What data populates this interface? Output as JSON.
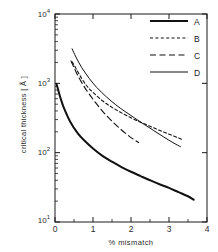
{
  "chart_data": {
    "type": "line",
    "title": "",
    "xlabel": "% mismatch",
    "ylabel": "critical thickness  [ Å ]",
    "xlim": [
      0,
      4
    ],
    "ylim": [
      10,
      10000
    ],
    "yscale": "log",
    "xscale": "linear",
    "grid": false,
    "legend_position": "top-right-inside",
    "xticks": [
      "0",
      "1",
      "2",
      "3",
      "4"
    ],
    "xtick_values": [
      0,
      1,
      2,
      3,
      4
    ],
    "yticks": [
      "10¹",
      "10²",
      "10³",
      "10⁴"
    ],
    "ytick_values": [
      10,
      100,
      1000,
      10000
    ],
    "ytick_bases": [
      "10",
      "10",
      "10",
      "10"
    ],
    "ytick_exponents": [
      "1",
      "2",
      "3",
      "4"
    ],
    "series": [
      {
        "name": "A",
        "style": "solid",
        "linewidth": 2.0,
        "color": "#111111",
        "x": [
          0.04,
          0.08,
          0.15,
          0.25,
          0.4,
          0.6,
          0.8,
          1.0,
          1.25,
          1.5,
          1.75,
          2.0,
          2.25,
          2.5,
          2.75,
          3.0,
          3.25,
          3.5,
          3.65
        ],
        "y": [
          980,
          820,
          600,
          420,
          280,
          190,
          145,
          115,
          90,
          74,
          62,
          53,
          46,
          40,
          35,
          31,
          27,
          23.5,
          21
        ]
      },
      {
        "name": "B",
        "style": "dashed-short",
        "linewidth": 1.1,
        "color": "#111111",
        "x": [
          0.45,
          0.55,
          0.7,
          0.85,
          1.0,
          1.25,
          1.5,
          1.75,
          2.0,
          2.25,
          2.5,
          2.75,
          3.0,
          3.25,
          3.35
        ],
        "y": [
          2050,
          1650,
          1180,
          900,
          740,
          560,
          450,
          375,
          318,
          275,
          240,
          210,
          185,
          163,
          155
        ]
      },
      {
        "name": "C",
        "style": "dashed-long",
        "linewidth": 1.1,
        "color": "#111111",
        "x": [
          0.42,
          0.5,
          0.6,
          0.75,
          0.9,
          1.1,
          1.3,
          1.5,
          1.7,
          1.9,
          2.05,
          2.2
        ],
        "y": [
          2100,
          1700,
          1300,
          930,
          700,
          500,
          370,
          285,
          225,
          182,
          158,
          140
        ]
      },
      {
        "name": "D",
        "style": "solid",
        "linewidth": 1.0,
        "color": "#111111",
        "x": [
          0.45,
          0.55,
          0.7,
          0.9,
          1.1,
          1.35,
          1.6,
          1.85,
          2.1,
          2.35,
          2.6,
          2.85,
          3.1,
          3.3
        ],
        "y": [
          3150,
          2400,
          1700,
          1180,
          870,
          640,
          490,
          390,
          315,
          255,
          208,
          170,
          140,
          122
        ]
      }
    ]
  },
  "legend": {
    "entries": [
      {
        "label": "A",
        "style": "solid-thick"
      },
      {
        "label": "B",
        "style": "dashed-short"
      },
      {
        "label": "C",
        "style": "dashed-long"
      },
      {
        "label": "D",
        "style": "solid-thin"
      }
    ]
  },
  "axes": {
    "frame_color": "#1a1a1a",
    "background": "#ffffff"
  }
}
